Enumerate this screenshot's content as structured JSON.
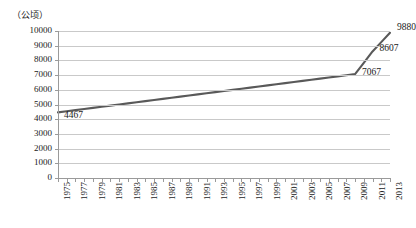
{
  "chart_data": {
    "type": "line",
    "title": "",
    "subtitle": "",
    "unit_label": "（公顷）",
    "xlabel": "",
    "ylabel": "",
    "ylim": [
      0,
      10000
    ],
    "ytick_step": 1000,
    "yticks": [
      "10000",
      "9000",
      "8000",
      "7000",
      "6000",
      "5000",
      "4000",
      "3000",
      "2000",
      "1000",
      "0"
    ],
    "xlim": [
      1975,
      2013
    ],
    "xtick_labels": [
      "1975",
      "1977",
      "1979",
      "1981",
      "1983",
      "1985",
      "1987",
      "1989",
      "1991",
      "1993",
      "1995",
      "1997",
      "1999",
      "2001",
      "2003",
      "2005",
      "2007",
      "2009",
      "2011",
      "2013"
    ],
    "grid": "horizontal",
    "legend": "none",
    "line_color": "#595959",
    "series": [
      {
        "name": "面积",
        "x": [
          1975,
          1976,
          1977,
          1978,
          1979,
          1980,
          1981,
          1982,
          1983,
          1984,
          1985,
          1986,
          1987,
          1988,
          1989,
          1990,
          1991,
          1992,
          1993,
          1994,
          1995,
          1996,
          1997,
          1998,
          1999,
          2000,
          2001,
          2002,
          2003,
          2004,
          2005,
          2006,
          2007,
          2008,
          2009,
          2010,
          2011,
          2012,
          2013
        ],
        "values": [
          4467,
          4543,
          4620,
          4696,
          4773,
          4849,
          4926,
          5002,
          5079,
          5155,
          5232,
          5308,
          5385,
          5461,
          5538,
          5614,
          5691,
          5767,
          5844,
          5920,
          5997,
          6073,
          6150,
          6226,
          6303,
          6379,
          6456,
          6532,
          6609,
          6685,
          6762,
          6838,
          6915,
          6991,
          7067,
          7837,
          8607,
          9243,
          9880
        ]
      }
    ],
    "data_labels": [
      {
        "text": "4467",
        "year": 1975,
        "value": 4467
      },
      {
        "text": "7067",
        "year": 2009,
        "value": 7067
      },
      {
        "text": "8607",
        "year": 2011,
        "value": 8607
      },
      {
        "text": "9880",
        "year": 2013,
        "value": 9880
      }
    ]
  }
}
